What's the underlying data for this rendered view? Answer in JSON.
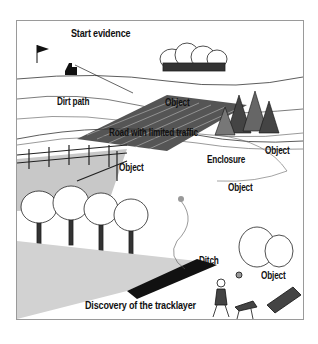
{
  "figure": {
    "type": "illustrated crime-scene landscape sketch",
    "labels": [
      {
        "id": "start",
        "text": "Start evidence"
      },
      {
        "id": "dirt-path",
        "text": "Dirt path"
      },
      {
        "id": "object-field",
        "text": "Object"
      },
      {
        "id": "road",
        "text": "Road with limited traffic"
      },
      {
        "id": "object-right",
        "text": "Object"
      },
      {
        "id": "enclosure",
        "text": "Enclosure"
      },
      {
        "id": "object-fence",
        "text": "Object"
      },
      {
        "id": "object-center",
        "text": "Object"
      },
      {
        "id": "ditch",
        "text": "Ditch"
      },
      {
        "id": "object-bush",
        "text": "Object"
      },
      {
        "id": "discovery",
        "text": "Discovery of the tracklayer"
      }
    ],
    "colors": {
      "ink": "#111111",
      "grass": "#c8c8c8",
      "frame": "#9a9a9a"
    }
  }
}
